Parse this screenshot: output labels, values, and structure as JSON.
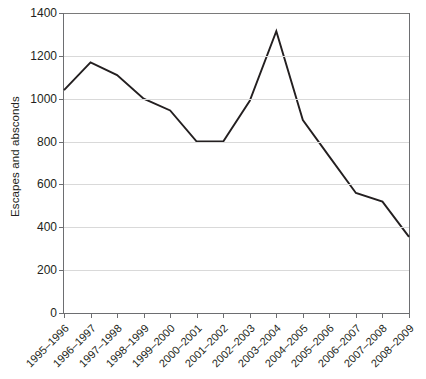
{
  "chart_data": {
    "type": "line",
    "title": "",
    "xlabel": "",
    "ylabel": "Escapes and absconds",
    "ylim": [
      0,
      1400
    ],
    "ytick_step": 200,
    "yticks": [
      0,
      200,
      400,
      600,
      800,
      1000,
      1200,
      1400
    ],
    "ytick_labels": [
      "0",
      "200",
      "400",
      "600",
      "800",
      "1000",
      "1200",
      "1400"
    ],
    "grid": "horizontal",
    "legend": "none",
    "line_color": "#231f20",
    "categories": [
      "1995–1996",
      "1996–1997",
      "1997–1998",
      "1998–1999",
      "1999–2000",
      "2000–2001",
      "2001–2002",
      "2002–2003",
      "2003–2004",
      "2004–2005",
      "2005–2006",
      "2006–2007",
      "2007–2008",
      "2008–2009"
    ],
    "values": [
      1040,
      1170,
      1110,
      1000,
      945,
      800,
      800,
      990,
      1315,
      900,
      730,
      560,
      520,
      355
    ],
    "series": [
      {
        "name": "Escapes and absconds",
        "values": [
          1040,
          1170,
          1110,
          1000,
          945,
          800,
          800,
          990,
          1315,
          900,
          730,
          560,
          520,
          355
        ]
      }
    ]
  }
}
